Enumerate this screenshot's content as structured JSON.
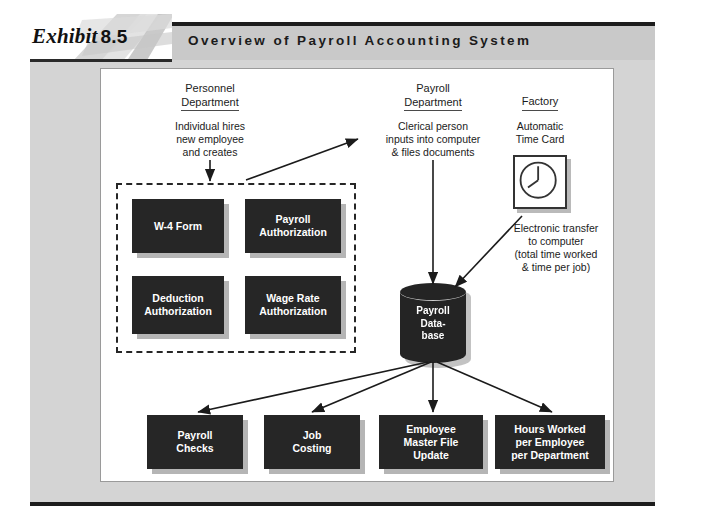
{
  "exhibit": {
    "word": "Exhibit",
    "number": "8.5"
  },
  "header": {
    "title": "Overview of Payroll Accounting System"
  },
  "columns": [
    {
      "heading_line1": "Personnel",
      "heading_line2": "Department"
    },
    {
      "heading_line1": "Payroll",
      "heading_line2": "Department"
    },
    {
      "heading_line1": "Factory",
      "heading_line2": ""
    }
  ],
  "notes": {
    "personnel": "Individual hires\nnew employee\nand creates",
    "personnel_l1": "Individual hires",
    "personnel_l2": "new employee",
    "personnel_l3": "and creates",
    "payroll_l1": "Clerical person",
    "payroll_l2": "inputs into computer",
    "payroll_l3": "& files documents",
    "factory_l1": "Automatic",
    "factory_l2": "Time Card",
    "transfer_l1": "Electronic transfer",
    "transfer_l2": "to computer",
    "transfer_l3": "(total time worked",
    "transfer_l4": "& time per job)"
  },
  "source_documents": [
    {
      "line1": "W-4 Form",
      "line2": ""
    },
    {
      "line1": "Payroll",
      "line2": "Authorization"
    },
    {
      "line1": "Deduction",
      "line2": "Authorization"
    },
    {
      "line1": "Wage Rate",
      "line2": "Authorization"
    }
  ],
  "database": {
    "line1": "Payroll",
    "line2": "Data-",
    "line3": "base"
  },
  "outputs": [
    {
      "line1": "Payroll",
      "line2": "Checks",
      "line3": ""
    },
    {
      "line1": "Job",
      "line2": "Costing",
      "line3": ""
    },
    {
      "line1": "Employee",
      "line2": "Master File",
      "line3": "Update"
    },
    {
      "line1": "Hours Worked",
      "line2": "per Employee",
      "line3": "per Department"
    }
  ],
  "colors": {
    "plate_bg": "#d4d4d4",
    "header_bar": "#c9c9c9",
    "box_fill": "#262626",
    "box_text": "#ffffff",
    "rule": "#1d1d1d",
    "panel_bg": "#ffffff"
  }
}
